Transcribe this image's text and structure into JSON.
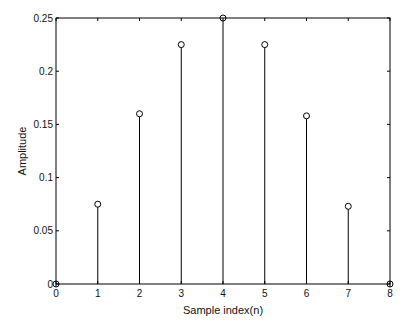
{
  "chart_data": {
    "type": "stem",
    "title": "",
    "xlabel": "Sample index(n)",
    "ylabel": "Amplitude",
    "x": [
      0,
      1,
      2,
      3,
      4,
      5,
      6,
      7,
      8
    ],
    "values": [
      0,
      0.075,
      0.16,
      0.225,
      0.25,
      0.225,
      0.158,
      0.073,
      0
    ],
    "xlim": [
      0,
      8
    ],
    "ylim": [
      0,
      0.25
    ],
    "xticks": [
      "0",
      "1",
      "2",
      "3",
      "4",
      "5",
      "6",
      "7",
      "8"
    ],
    "yticks": [
      "0",
      "0.05",
      "0.1",
      "0.15",
      "0.2",
      "0.25"
    ],
    "ytick_values": [
      0,
      0.05,
      0.1,
      0.15,
      0.2,
      0.25
    ],
    "grid": false,
    "marker": "circle-open",
    "color": "#000000"
  }
}
